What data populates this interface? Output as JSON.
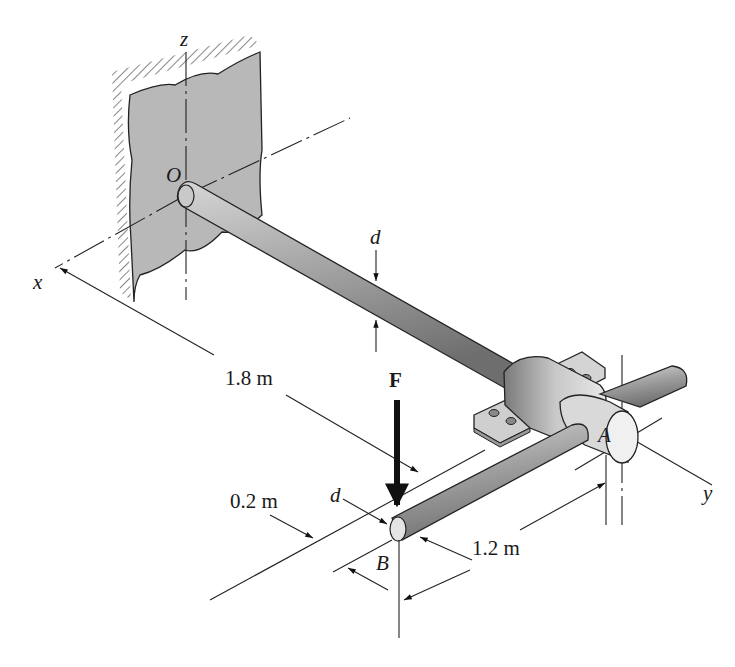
{
  "diagram": {
    "labels": {
      "axis_z": "z",
      "axis_x": "x",
      "axis_y": "y",
      "origin": "O",
      "point_a": "A",
      "point_b": "B",
      "force": "F",
      "diameter_shaft": "d",
      "diameter_arm": "d"
    },
    "dimensions": {
      "shaft_length": "1.8 m",
      "offset": "0.2 m",
      "arm_length": "1.2 m"
    },
    "colors": {
      "wall_fill": "#b8b8b8",
      "shaft_fill": "#9a9a9a",
      "line": "#222222",
      "background": "#ffffff"
    }
  }
}
